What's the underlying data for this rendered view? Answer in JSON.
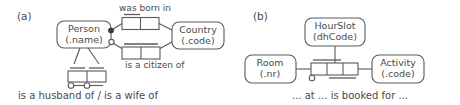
{
  "diagram": {
    "type": "orm-fact-type-diagram",
    "background_color": "#ffffff",
    "stroke_color": "#5a5a5a",
    "text_color": "#4a4a4a",
    "panels": [
      {
        "id": "a",
        "label": "(a)",
        "entities": [
          {
            "id": "person",
            "name": "Person",
            "reference": "(.name)"
          },
          {
            "id": "country",
            "name": "Country",
            "reference": "(.code)"
          }
        ],
        "fact_types": [
          {
            "id": "born-in",
            "label": "was born in",
            "label_position": "above",
            "roles": 2,
            "uniqueness_span": "first-role",
            "mandatory": true
          },
          {
            "id": "citizen-of",
            "label": "is a citizen of",
            "label_position": "below",
            "roles": 2,
            "uniqueness_span": "both-roles",
            "mandatory": false
          },
          {
            "id": "spouse-of",
            "label": "is a husband of / is a wife of",
            "label_position": "below",
            "roles": 2,
            "uniqueness_span": "each-role",
            "ring_constraint": "irreflexive-asymmetric",
            "ring_symbol": "circle-line-circle"
          }
        ]
      },
      {
        "id": "b",
        "label": "(b)",
        "entities": [
          {
            "id": "room",
            "name": "Room",
            "reference": "(.nr)"
          },
          {
            "id": "hourslot",
            "name": "HourSlot",
            "reference": "(dhCode)"
          },
          {
            "id": "activity",
            "name": "Activity",
            "reference": "(.code)"
          }
        ],
        "fact_types": [
          {
            "id": "booking",
            "label": "... at ... is booked for ...",
            "label_position": "below",
            "roles": 3,
            "uniqueness_span": "first-two-roles-and-last-two-roles",
            "mandatory": true
          }
        ]
      }
    ]
  }
}
